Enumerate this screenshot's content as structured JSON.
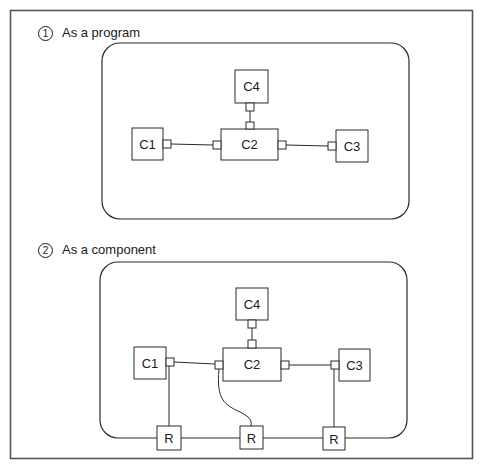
{
  "sections": [
    {
      "number": "1",
      "title": "As a program",
      "components": {
        "c1": "C1",
        "c2": "C2",
        "c3": "C3",
        "c4": "C4"
      }
    },
    {
      "number": "2",
      "title": "As a component",
      "components": {
        "c1": "C1",
        "c2": "C2",
        "c3": "C3",
        "c4": "C4"
      },
      "relays": [
        "R",
        "R",
        "R"
      ]
    }
  ],
  "colors": {
    "stroke": "#2a2a2a",
    "frame": "#555555",
    "background": "#ffffff"
  }
}
